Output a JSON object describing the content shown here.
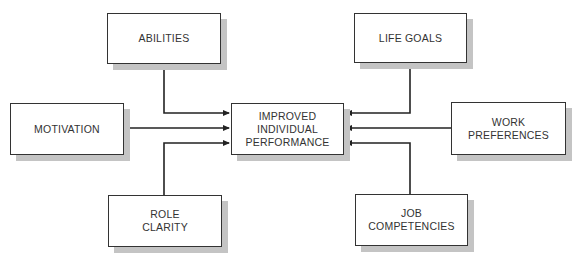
{
  "diagram": {
    "type": "influence-diagram",
    "center": {
      "lines": [
        "IMPROVED",
        "INDIVIDUAL",
        "PERFORMANCE"
      ]
    },
    "factors": [
      {
        "id": "abilities",
        "lines": [
          "ABILITIES"
        ],
        "position": "top-left"
      },
      {
        "id": "life_goals",
        "lines": [
          "LIFE GOALS"
        ],
        "position": "top-right"
      },
      {
        "id": "motivation",
        "lines": [
          "MOTIVATION"
        ],
        "position": "left"
      },
      {
        "id": "work_preferences",
        "lines": [
          "WORK",
          "PREFERENCES"
        ],
        "position": "right"
      },
      {
        "id": "role_clarity",
        "lines": [
          "ROLE",
          "CLARITY"
        ],
        "position": "bottom-left"
      },
      {
        "id": "job_competencies",
        "lines": [
          "JOB",
          "COMPETENCIES"
        ],
        "position": "bottom-right"
      }
    ],
    "edges": [
      {
        "from": "abilities",
        "to": "center"
      },
      {
        "from": "life_goals",
        "to": "center"
      },
      {
        "from": "motivation",
        "to": "center"
      },
      {
        "from": "work_preferences",
        "to": "center"
      },
      {
        "from": "role_clarity",
        "to": "center"
      },
      {
        "from": "job_competencies",
        "to": "center"
      }
    ],
    "colors": {
      "line": "#222222",
      "shadow": "#c4c4c4",
      "text": "#333333"
    }
  }
}
